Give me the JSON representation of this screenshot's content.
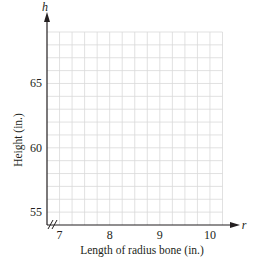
{
  "chart_data": {
    "type": "scatter",
    "title": "",
    "xlabel": "Length of radius bone (in.)",
    "ylabel": "Height (in.)",
    "x_variable": "r",
    "y_variable": "h",
    "xlim": [
      6.75,
      10.25
    ],
    "ylim": [
      54,
      69
    ],
    "x_ticks": [
      7,
      8,
      9,
      10
    ],
    "y_ticks": [
      55,
      60,
      65
    ],
    "x_tick_labels": [
      "7",
      "8",
      "9",
      "10"
    ],
    "y_tick_labels": [
      "55",
      "60",
      "65"
    ],
    "x_grid_step": 0.25,
    "y_grid_step": 1,
    "grid": true,
    "axis_break": "x-y origin (//)",
    "series": [],
    "legend": null
  },
  "colors": {
    "axis": "#231f20",
    "grid": "#d9d9d9",
    "background": "#ffffff"
  }
}
